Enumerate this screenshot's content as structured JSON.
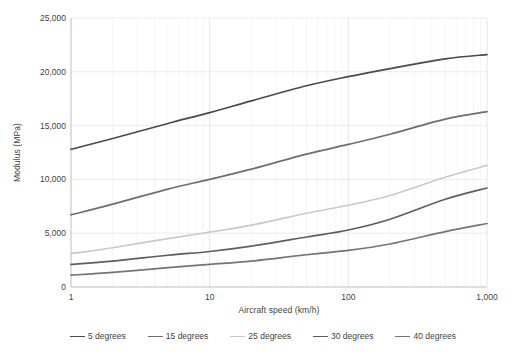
{
  "chart_data": {
    "type": "line",
    "title": "",
    "xlabel": "Aircraft speed (km/h)",
    "ylabel": "Modulus (MPa)",
    "xscale": "log",
    "yscale": "linear",
    "xlim": [
      1,
      1000
    ],
    "ylim": [
      0,
      25000
    ],
    "grid": true,
    "legend_position": "bottom",
    "x_ticks": [
      {
        "value": 1,
        "label": "1"
      },
      {
        "value": 10,
        "label": "10"
      },
      {
        "value": 100,
        "label": "100"
      },
      {
        "value": 1000,
        "label": "1,000"
      }
    ],
    "y_ticks": [
      {
        "value": 0,
        "label": "0"
      },
      {
        "value": 5000,
        "label": "5,000"
      },
      {
        "value": 10000,
        "label": "10,000"
      },
      {
        "value": 15000,
        "label": "15,000"
      },
      {
        "value": 20000,
        "label": "20,000"
      },
      {
        "value": 25000,
        "label": "25,000"
      }
    ],
    "x": [
      1,
      2,
      5,
      10,
      20,
      50,
      100,
      200,
      500,
      1000
    ],
    "series": [
      {
        "name": "5 degrees",
        "color": "#4a4a4a",
        "values": [
          12800,
          13800,
          15200,
          16200,
          17300,
          18700,
          19550,
          20300,
          21200,
          21600
        ]
      },
      {
        "name": "15 degrees",
        "color": "#6e6e6e",
        "values": [
          6700,
          7700,
          9100,
          10000,
          10950,
          12350,
          13250,
          14200,
          15600,
          16300
        ]
      },
      {
        "name": "25 degrees",
        "color": "#c9c9c9",
        "values": [
          3100,
          3650,
          4500,
          5100,
          5750,
          6850,
          7600,
          8500,
          10200,
          11300
        ]
      },
      {
        "name": "30 degrees",
        "color": "#5e5e5e",
        "values": [
          2100,
          2400,
          2950,
          3300,
          3800,
          4650,
          5300,
          6300,
          8150,
          9200
        ]
      },
      {
        "name": "40 degrees",
        "color": "#757575",
        "values": [
          1100,
          1350,
          1800,
          2100,
          2400,
          3000,
          3400,
          4000,
          5150,
          5900
        ]
      }
    ]
  },
  "axis": {
    "x_title": "Aircraft speed (km/h)",
    "y_title": "Modulus (MPa)"
  }
}
